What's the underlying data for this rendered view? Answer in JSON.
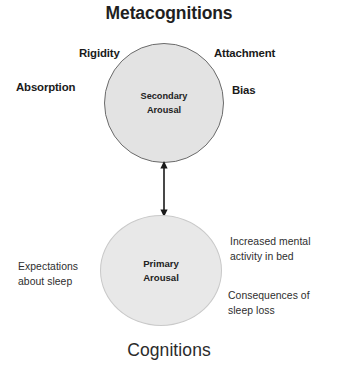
{
  "diagram": {
    "title_top": "Metacognitions",
    "title_bottom": "Cognitions",
    "colors": {
      "secondary_circle_fill": "#e3e3e3",
      "secondary_circle_stroke": "#6b6b6b",
      "primary_circle_fill": "#e8e8e8",
      "primary_circle_stroke": "#c9c9c9",
      "text": "#1a1a1a",
      "arrow": "#1a1a1a",
      "background": "#ffffff"
    },
    "nodes": [
      {
        "id": "secondary-arousal",
        "line1": "Secondary",
        "line2": "Arousal"
      },
      {
        "id": "primary-arousal",
        "line1": "Primary",
        "line2": "Arousal"
      }
    ],
    "metacognition_labels": [
      {
        "id": "rigidity",
        "text": "Rigidity"
      },
      {
        "id": "attachment",
        "text": "Attachment"
      },
      {
        "id": "absorption",
        "text": "Absorption"
      },
      {
        "id": "bias",
        "text": "Bias"
      }
    ],
    "cognition_labels": [
      {
        "id": "expectations",
        "line1": "Expectations",
        "line2": "about sleep"
      },
      {
        "id": "increased",
        "line1": "Increased mental",
        "line2": "activity in bed"
      },
      {
        "id": "consequences",
        "line1": "Consequences of",
        "line2": "sleep loss"
      }
    ],
    "connector": {
      "type": "double-headed-arrow",
      "orientation": "vertical",
      "from": "secondary-arousal",
      "to": "primary-arousal"
    }
  }
}
